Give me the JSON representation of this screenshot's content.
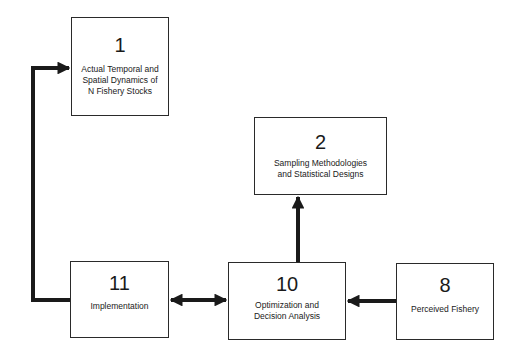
{
  "diagram": {
    "nodes": [
      {
        "id": "1",
        "number": "1",
        "label": "Actual Temporal and Spatial Dynamics of N Fishery Stocks",
        "lines": [
          "Actual Temporal and",
          "Spatial Dynamics of",
          "N Fishery Stocks"
        ]
      },
      {
        "id": "2",
        "number": "2",
        "label": "Sampling Methodologies and Statistical Designs",
        "lines": [
          "Sampling Methodologies",
          "and Statistical Designs"
        ]
      },
      {
        "id": "11",
        "number": "11",
        "label": "Implementation",
        "lines": [
          "Implementation"
        ]
      },
      {
        "id": "10",
        "number": "10",
        "label": "Optimization and Decision Analysis",
        "lines": [
          "Optimization and",
          "Decision Analysis"
        ]
      },
      {
        "id": "8",
        "number": "8",
        "label": "Perceived Fishery",
        "lines": [
          "Perceived Fishery"
        ]
      }
    ],
    "edges": [
      {
        "from": "11",
        "to": "1",
        "type": "directed"
      },
      {
        "from": "10",
        "to": "2",
        "type": "directed"
      },
      {
        "from": "11",
        "to": "10",
        "type": "bidirectional"
      },
      {
        "from": "8",
        "to": "10",
        "type": "directed"
      }
    ]
  }
}
